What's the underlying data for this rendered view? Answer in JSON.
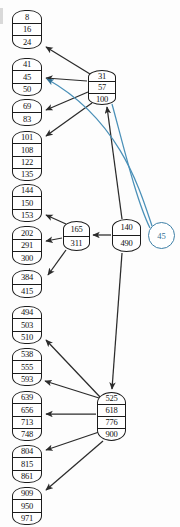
{
  "diagram": {
    "type": "btree",
    "colors": {
      "node_border": "#1c1c1c",
      "node_fill": "#ffffff",
      "edge": "#2b2b2b",
      "highlight": "#4a90b8",
      "text": "#101010"
    },
    "query_badge": {
      "label": "45",
      "x": 148,
      "y": 222,
      "size": 25
    },
    "nodes": [
      {
        "id": "root",
        "role": "internal-root",
        "keys": [
          "31",
          "57",
          "100"
        ],
        "x": 88,
        "y": 70,
        "w": 28,
        "h": 35
      },
      {
        "id": "mid",
        "role": "internal",
        "keys": [
          "140",
          "490"
        ],
        "x": 112,
        "y": 219,
        "w": 29,
        "h": 33
      },
      {
        "id": "inner-165",
        "role": "internal",
        "keys": [
          "165",
          "311"
        ],
        "x": 63,
        "y": 221,
        "w": 27,
        "h": 30
      },
      {
        "id": "inner-525",
        "role": "internal",
        "keys": [
          "525",
          "618",
          "776",
          "900"
        ],
        "x": 97,
        "y": 392,
        "w": 29,
        "h": 49
      },
      {
        "id": "leaf-1",
        "role": "leaf",
        "keys": [
          "8",
          "16",
          "24"
        ],
        "x": 12,
        "y": 10,
        "w": 30,
        "h": 39
      },
      {
        "id": "leaf-2",
        "role": "leaf",
        "keys": [
          "41",
          "45",
          "50"
        ],
        "x": 12,
        "y": 58,
        "w": 30,
        "h": 38
      },
      {
        "id": "leaf-3",
        "role": "leaf",
        "keys": [
          "69",
          "83"
        ],
        "x": 12,
        "y": 99,
        "w": 30,
        "h": 27
      },
      {
        "id": "leaf-4",
        "role": "leaf",
        "keys": [
          "101",
          "108",
          "122",
          "135"
        ],
        "x": 12,
        "y": 131,
        "w": 30,
        "h": 50
      },
      {
        "id": "leaf-5",
        "role": "leaf",
        "keys": [
          "144",
          "150",
          "153"
        ],
        "x": 12,
        "y": 184,
        "w": 30,
        "h": 38
      },
      {
        "id": "leaf-6",
        "role": "leaf",
        "keys": [
          "202",
          "291",
          "300"
        ],
        "x": 12,
        "y": 226,
        "w": 30,
        "h": 39
      },
      {
        "id": "leaf-7",
        "role": "leaf",
        "keys": [
          "384",
          "415"
        ],
        "x": 12,
        "y": 270,
        "w": 30,
        "h": 28
      },
      {
        "id": "leaf-8",
        "role": "leaf",
        "keys": [
          "494",
          "503",
          "510"
        ],
        "x": 12,
        "y": 306,
        "w": 30,
        "h": 38
      },
      {
        "id": "leaf-9",
        "role": "leaf",
        "keys": [
          "538",
          "555",
          "593"
        ],
        "x": 12,
        "y": 348,
        "w": 30,
        "h": 38
      },
      {
        "id": "leaf-10",
        "role": "leaf",
        "keys": [
          "639",
          "656",
          "713",
          "748"
        ],
        "x": 12,
        "y": 391,
        "w": 30,
        "h": 50
      },
      {
        "id": "leaf-11",
        "role": "leaf",
        "keys": [
          "804",
          "815",
          "861"
        ],
        "x": 12,
        "y": 445,
        "w": 30,
        "h": 38
      },
      {
        "id": "leaf-12",
        "role": "leaf",
        "keys": [
          "909",
          "950",
          "971"
        ],
        "x": 12,
        "y": 487,
        "w": 30,
        "h": 38
      }
    ],
    "edges": [
      {
        "from": "root",
        "to": "leaf-1",
        "highlight": false
      },
      {
        "from": "root",
        "to": "leaf-2",
        "highlight": false
      },
      {
        "from": "root",
        "to": "leaf-3",
        "highlight": false
      },
      {
        "from": "root",
        "to": "leaf-4",
        "highlight": false
      },
      {
        "from": "mid",
        "to": "root",
        "highlight": false
      },
      {
        "from": "mid",
        "to": "inner-165",
        "highlight": false
      },
      {
        "from": "mid",
        "to": "inner-525",
        "highlight": false
      },
      {
        "from": "inner-165",
        "to": "leaf-5",
        "highlight": false
      },
      {
        "from": "inner-165",
        "to": "leaf-6",
        "highlight": false
      },
      {
        "from": "inner-165",
        "to": "leaf-7",
        "highlight": false
      },
      {
        "from": "inner-525",
        "to": "leaf-8",
        "highlight": false
      },
      {
        "from": "inner-525",
        "to": "leaf-9",
        "highlight": false
      },
      {
        "from": "inner-525",
        "to": "leaf-10",
        "highlight": false
      },
      {
        "from": "inner-525",
        "to": "leaf-11",
        "highlight": false
      },
      {
        "from": "inner-525",
        "to": "leaf-12",
        "highlight": false
      },
      {
        "from": "query",
        "to": "root",
        "highlight": true
      },
      {
        "from": "query",
        "to": "leaf-2",
        "highlight": true
      }
    ]
  }
}
